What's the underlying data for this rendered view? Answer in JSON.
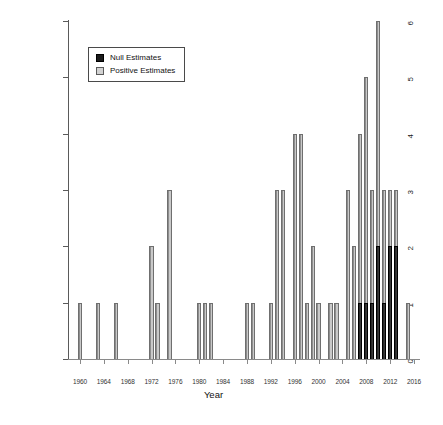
{
  "chart_data": {
    "type": "bar",
    "title": "",
    "xlabel": "Year",
    "ylabel": "Number of Major Studies",
    "xlim": [
      1958,
      2017
    ],
    "ylim": [
      0,
      6
    ],
    "grid": false,
    "legend_position": "top-left",
    "y_ticks": [
      0,
      1,
      2,
      3,
      4,
      5,
      6
    ],
    "x_ticks": [
      1960,
      1964,
      1968,
      1972,
      1976,
      1980,
      1984,
      1988,
      1992,
      1996,
      2000,
      2004,
      2008,
      2012,
      2016
    ],
    "legend": [
      {
        "label": "Null Estimates",
        "color": "#1b1b1b",
        "key": "null"
      },
      {
        "label": "Positive Estimates",
        "color": "#d2d2d2",
        "key": "positive"
      }
    ],
    "series": [
      {
        "name": "Positive Estimates",
        "key": "positive",
        "color": "#b4b4b4"
      },
      {
        "name": "Null Estimates",
        "key": "null",
        "color": "#1b1b1b"
      }
    ],
    "bars": [
      {
        "year": 1960,
        "value": 1,
        "series": "positive"
      },
      {
        "year": 1963,
        "value": 1,
        "series": "positive"
      },
      {
        "year": 1966,
        "value": 1,
        "series": "positive"
      },
      {
        "year": 1972,
        "value": 2,
        "series": "positive"
      },
      {
        "year": 1973,
        "value": 1,
        "series": "positive"
      },
      {
        "year": 1975,
        "value": 3,
        "series": "positive"
      },
      {
        "year": 1980,
        "value": 1,
        "series": "positive"
      },
      {
        "year": 1981,
        "value": 1,
        "series": "positive"
      },
      {
        "year": 1982,
        "value": 1,
        "series": "positive"
      },
      {
        "year": 1988,
        "value": 1,
        "series": "positive"
      },
      {
        "year": 1989,
        "value": 1,
        "series": "positive"
      },
      {
        "year": 1992,
        "value": 1,
        "series": "positive"
      },
      {
        "year": 1993,
        "value": 3,
        "series": "positive"
      },
      {
        "year": 1994,
        "value": 3,
        "series": "positive"
      },
      {
        "year": 1996,
        "value": 4,
        "series": "positive"
      },
      {
        "year": 1997,
        "value": 4,
        "series": "positive"
      },
      {
        "year": 1998,
        "value": 1,
        "series": "positive"
      },
      {
        "year": 1999,
        "value": 2,
        "series": "positive"
      },
      {
        "year": 2000,
        "value": 1,
        "series": "positive"
      },
      {
        "year": 2002,
        "value": 1,
        "series": "positive"
      },
      {
        "year": 2003,
        "value": 1,
        "series": "positive"
      },
      {
        "year": 2005,
        "value": 3,
        "series": "positive"
      },
      {
        "year": 2006,
        "value": 2,
        "series": "positive"
      },
      {
        "year": 2007,
        "value": 4,
        "series": "positive"
      },
      {
        "year": 2008,
        "value": 5,
        "series": "positive"
      },
      {
        "year": 2009,
        "value": 3,
        "series": "positive"
      },
      {
        "year": 2010,
        "value": 6,
        "series": "positive"
      },
      {
        "year": 2011,
        "value": 3,
        "series": "positive"
      },
      {
        "year": 2012,
        "value": 3,
        "series": "positive"
      },
      {
        "year": 2013,
        "value": 3,
        "series": "positive"
      },
      {
        "year": 2015,
        "value": 1,
        "series": "positive"
      },
      {
        "year": 2007,
        "value": 1,
        "series": "null"
      },
      {
        "year": 2008,
        "value": 1,
        "series": "null"
      },
      {
        "year": 2009,
        "value": 1,
        "series": "null"
      },
      {
        "year": 2010,
        "value": 2,
        "series": "null"
      },
      {
        "year": 2011,
        "value": 1,
        "series": "null"
      },
      {
        "year": 2012,
        "value": 2,
        "series": "null"
      },
      {
        "year": 2013,
        "value": 2,
        "series": "null"
      }
    ]
  }
}
